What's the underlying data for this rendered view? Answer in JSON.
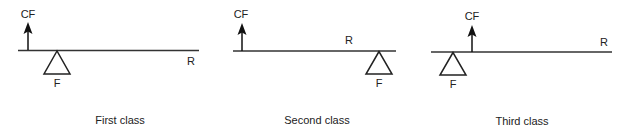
{
  "colors": {
    "line": "#333333",
    "text": "#222222",
    "background": "#ffffff"
  },
  "legend": {
    "CF": "applied force (arrow)",
    "F": "fulcrum (triangle)",
    "R": "resistance"
  },
  "levers": [
    {
      "caption": "First class",
      "force_label": "CF",
      "fulcrum_label": "F",
      "resistance_label": "R",
      "order_left_to_right": [
        "CF",
        "F",
        "R"
      ]
    },
    {
      "caption": "Second class",
      "force_label": "CF",
      "fulcrum_label": "F",
      "resistance_label": "R",
      "order_left_to_right": [
        "CF",
        "R",
        "F"
      ]
    },
    {
      "caption": "Third class",
      "force_label": "CF",
      "fulcrum_label": "F",
      "resistance_label": "R",
      "order_left_to_right": [
        "F",
        "CF",
        "R"
      ]
    }
  ]
}
